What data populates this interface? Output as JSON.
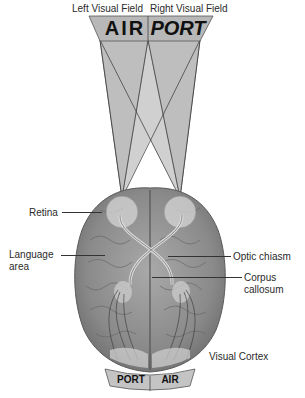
{
  "header": {
    "left_field": "Left Visual Field",
    "right_field": "Right Visual Field"
  },
  "sign_top": {
    "left_word": "AIR",
    "right_word": "PORT"
  },
  "sign_bottom": {
    "left_word": "PORT",
    "right_word": "AIR"
  },
  "labels": {
    "retina": "Retina",
    "language_line1": "Language",
    "language_line2": "area",
    "optic_chiasm": "Optic chiasm",
    "corpus_line1": "Corpus",
    "corpus_line2": "callosum",
    "visual_cortex": "Visual Cortex"
  },
  "colors": {
    "sign_fill": "#b8b8b8",
    "cone_fill": "#bdbdbd",
    "brain_fill": "#8e8e8e",
    "brain_dark": "#6a6a6a",
    "text": "#222222"
  }
}
